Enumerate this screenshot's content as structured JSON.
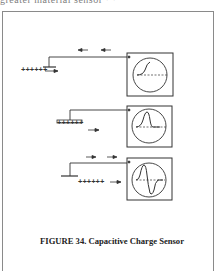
{
  "page": {
    "cropped_top_text": "greater  material   sensor          ·  ·"
  },
  "figure": {
    "caption": "FIGURE 34.  Capacitive Charge Sensor",
    "line_color": "#333333",
    "panels": [
      {
        "id": 1,
        "charge_label": "++++++",
        "charge_motion": "right",
        "wire_signal_arrows": "left",
        "scope_trace": "rising-step"
      },
      {
        "id": 2,
        "charge_label": "++++++",
        "charge_motion": "right",
        "wire_signal_arrows": "none",
        "scope_trace": "positive-pulse"
      },
      {
        "id": 3,
        "charge_label": "++++++",
        "charge_motion": "right",
        "wire_signal_arrows": "right",
        "scope_trace": "bipolar-pulse"
      }
    ]
  }
}
